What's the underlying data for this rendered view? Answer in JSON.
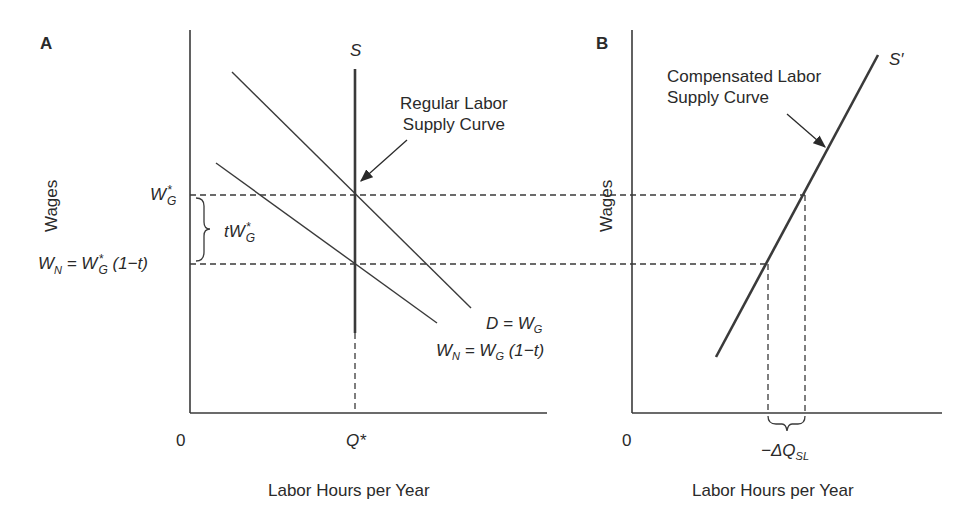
{
  "panel_a": {
    "label": "A",
    "y_axis_label": "Wages",
    "x_axis_label": "Labor Hours per Year",
    "origin": "0",
    "supply_label": "S",
    "q_star": "Q*",
    "wg_star_main": "W",
    "wg_star_sup": "*",
    "wg_star_sub": "G",
    "wn_left": "W",
    "wn_sub": "N",
    "wn_eq": " = W",
    "wn_rest": " (1−t)",
    "tax_wedge_label": "tW",
    "annotation": [
      "Regular Labor",
      "Supply Curve"
    ],
    "demand_label_main": "D = W",
    "demand_label_sub": "G",
    "net_demand_a": "W",
    "net_demand_sub1": "N",
    "net_demand_b": " = W",
    "net_demand_sub2": "G",
    "net_demand_c": " (1−t)"
  },
  "panel_b": {
    "label": "B",
    "y_axis_label": "Wages",
    "x_axis_label": "Labor Hours per Year",
    "origin": "0",
    "supply_label": "S′",
    "annotation": [
      "Compensated Labor",
      "Supply Curve"
    ],
    "delta_label": "−ΔQ",
    "delta_sub": "SL"
  },
  "colors": {
    "line": "#3a3a3a",
    "text": "#2a2a2a",
    "background": "#ffffff"
  }
}
